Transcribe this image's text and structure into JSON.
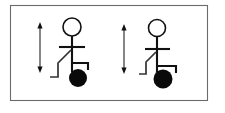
{
  "diagram": {
    "background_color": "#ffffff",
    "frame": {
      "name": "outer border",
      "x": 10,
      "y": 5,
      "width": 198,
      "height": 96,
      "stroke_color": "#6b6b6b",
      "stroke_width": 1.1
    },
    "colors": {
      "stroke": "#111111",
      "frame": "#6b6b6b",
      "ball": "#0a0a0a",
      "head_fill": "#ffffff",
      "arrow": "#444444"
    },
    "figures": [
      {
        "id": "figure-left",
        "label": "left stick figure",
        "head": {
          "cx": 72,
          "cy": 27,
          "r": 9
        },
        "spine": {
          "x1": 72,
          "y1": 36,
          "x2": 72,
          "y2": 72
        },
        "shoulder_bar": {
          "x1": 59,
          "y1": 47,
          "x2": 85,
          "y2": 47
        },
        "front_arm": {
          "points": "72,63 88,63 88,70"
        },
        "back_leg": {
          "points": "71,50 58,63 58,77 50,77"
        },
        "ball": {
          "cx": 78,
          "cy": 78,
          "r": 9
        },
        "arrow": {
          "x": 40,
          "y_top": 22,
          "y_bottom": 73,
          "length_px": 51,
          "heads": "both"
        }
      },
      {
        "id": "figure-right",
        "label": "right stick figure",
        "head": {
          "cx": 157,
          "cy": 28,
          "r": 8.5
        },
        "spine": {
          "x1": 157,
          "y1": 36,
          "x2": 157,
          "y2": 72
        },
        "shoulder_bar": {
          "x1": 145,
          "y1": 49,
          "x2": 170,
          "y2": 49
        },
        "front_arm": {
          "points": "157,66 176,66 176,73"
        },
        "back_leg": {
          "points": "156,52 146,62 146,74 139,74"
        },
        "ball": {
          "cx": 163,
          "cy": 79,
          "r": 9.5
        },
        "arrow": {
          "x": 124,
          "y_top": 24,
          "y_bottom": 74,
          "length_px": 50,
          "heads": "both"
        }
      }
    ],
    "arrow_meta": {
      "name": "vertical double-headed arrow",
      "head_half_width": 2.6,
      "head_height": 4.5
    }
  }
}
